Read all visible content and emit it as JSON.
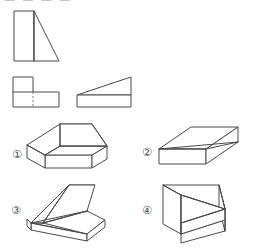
{
  "page": {
    "kind": "engineering-graphics-multiple-choice",
    "background_color": "#ffffff",
    "line_color": "#4a4a4a",
    "hidden_line_color": "#7a7a7a",
    "width": 253,
    "height": 248,
    "cropped_header_text": "— — —  —"
  },
  "views": {
    "front": {
      "name": "front-view",
      "description": "Rectangle at left with right triangle sloping down to the right",
      "x": 13,
      "y": 10,
      "width": 45,
      "height": 50,
      "rect_width": 20,
      "polyline": "0,0 20,0 20,50 0,50 0,0",
      "triangle": "20,0 45,50 20,50"
    },
    "top": {
      "name": "top-view",
      "description": "L-shaped plan with a vertical dashed hidden line",
      "x": 12,
      "y": 76,
      "width": 46,
      "height": 30,
      "outline": "0,0 20,0 20,15 46,15 46,30 0,30 0,0",
      "solid_divider": "0,15 20,15",
      "hidden_line": "20,15 20,30"
    },
    "side": {
      "name": "side-view",
      "description": "Rectangle base with a wedge triangle sloping up to the right",
      "x": 76,
      "y": 76,
      "width": 54,
      "height": 30,
      "base": "0,18 54,18 54,30 0,30 0,18",
      "wedge": "0,18 54,0 54,18"
    }
  },
  "choices": [
    {
      "id": "choice-1",
      "label": "①",
      "label_x": 10,
      "label_y": 148,
      "fig_x": 22,
      "fig_y": 118,
      "description": "Isometric solid: long wedge ramp on upper-left joined to a rectangular block at lower-right"
    },
    {
      "id": "choice-2",
      "label": "②",
      "label_x": 140,
      "label_y": 146,
      "fig_x": 152,
      "fig_y": 118,
      "description": "Isometric solid: flat rectangular block with a shallow diagonal wedge across the top face"
    },
    {
      "id": "choice-3",
      "label": "③",
      "label_x": 9,
      "label_y": 204,
      "fig_x": 24,
      "fig_y": 178,
      "description": "Isometric solid: steep wedge ramp rising to the upper-right merging into a wide block"
    },
    {
      "id": "choice-4",
      "label": "④",
      "label_x": 140,
      "label_y": 204,
      "fig_x": 154,
      "fig_y": 178,
      "description": "Isometric solid: block with a triangular slot cut, tall face at the left"
    }
  ]
}
